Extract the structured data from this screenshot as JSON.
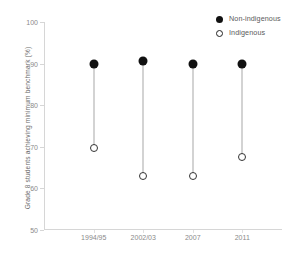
{
  "chart_data": {
    "type": "scatter",
    "title": "",
    "xlabel": "",
    "ylabel": "Grade 8 students achieving minimum benchmark (%)",
    "categories": [
      "1994/95",
      "2002/03",
      "2007",
      "2011"
    ],
    "ylim": [
      50,
      100
    ],
    "yticks": [
      50,
      60,
      70,
      80,
      90,
      100
    ],
    "ytick_labels": [
      "50",
      "60",
      "70",
      "80",
      "90",
      "100"
    ],
    "grid": false,
    "legend_position": "top-right",
    "series": [
      {
        "name": "Non-indigenous",
        "marker": "filled-circle",
        "color": "#111111",
        "values": [
          89.8,
          90.7,
          89.9,
          89.8
        ]
      },
      {
        "name": "Indigenous",
        "marker": "open-circle",
        "color": "#ffffff",
        "values": [
          69.8,
          63.0,
          62.9,
          67.6
        ]
      }
    ]
  },
  "legend": {
    "items": [
      {
        "label": "Non-indigenous",
        "marker": "filled-circle"
      },
      {
        "label": "Indigenous",
        "marker": "open-circle"
      }
    ]
  },
  "colors": {
    "non_indigenous": "#111111",
    "indigenous": "#ffffff",
    "connector": "#a8a8a8",
    "axis": "#d6d6d6",
    "tick_text": "#8a8a8a",
    "axis_title": "#6a6a6a",
    "background": "#ffffff"
  }
}
